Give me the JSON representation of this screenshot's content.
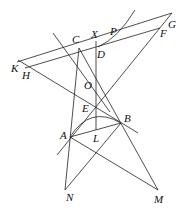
{
  "diagram": {
    "type": "geometry",
    "stroke_color": "#222222",
    "labels": {
      "C": "C",
      "X": "X",
      "P": "P",
      "G": "G",
      "F": "F",
      "D": "D",
      "K": "K",
      "H": "H",
      "O": "O",
      "E": "E",
      "B": "B",
      "A": "A",
      "L": "L",
      "N": "N",
      "M": "M"
    },
    "points": {
      "C": [
        78,
        48
      ],
      "D": [
        96,
        48
      ],
      "X": [
        96,
        40
      ],
      "G": [
        167,
        17
      ],
      "F": [
        160,
        28
      ],
      "K": [
        17,
        62
      ],
      "H": [
        25,
        69
      ],
      "O": [
        96,
        82
      ],
      "E": [
        96,
        107
      ],
      "B": [
        121,
        123
      ],
      "A": [
        70,
        137
      ],
      "L": [
        96,
        130
      ],
      "N": [
        65,
        190
      ],
      "M": [
        158,
        190
      ],
      "P": [
        110,
        35
      ]
    }
  }
}
